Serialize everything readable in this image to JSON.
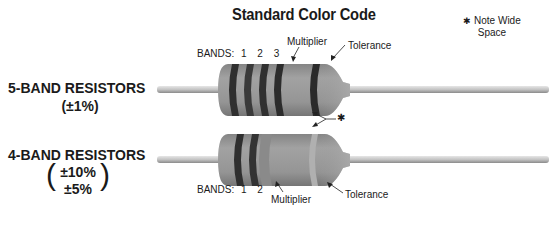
{
  "title": "Standard Color Code",
  "note": {
    "symbol": "✱",
    "line1": "Note Wide",
    "line2": "Space"
  },
  "five_band": {
    "title": "5-BAND RESISTORS",
    "tolerance": "(±1%)",
    "bands_label": "BANDS:",
    "band_numbers": [
      "1",
      "2",
      "3"
    ],
    "multiplier_label": "Multiplier",
    "tolerance_label": "Tolerance"
  },
  "four_band": {
    "title": "4-BAND RESISTORS",
    "tolerance_lines": [
      "±10%",
      "±5%"
    ],
    "paren_open": "(",
    "paren_close": ")",
    "bands_label": "BANDS:",
    "band_numbers": [
      "1",
      "2"
    ],
    "multiplier_label": "Multiplier",
    "tolerance_label": "Tolerance"
  },
  "wide_space_marker": "✱",
  "colors": {
    "body": "#8e8e8e",
    "body_light": "#a8a8a8",
    "band_dark": "#2f2f2f",
    "band_mid": "#6a6a6a",
    "lead": "#b8b8b8",
    "text": "#1a1a1a"
  }
}
